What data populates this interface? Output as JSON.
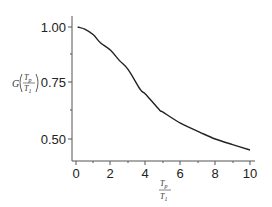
{
  "chart_data": {
    "type": "line",
    "title": "",
    "xlabel": "Tp/T1",
    "ylabel": "G(Tp/T1)",
    "xlim": [
      0,
      10
    ],
    "ylim": [
      0.45,
      1.02
    ],
    "x_ticks": [
      "0",
      "2",
      "4",
      "6",
      "8",
      "10"
    ],
    "y_ticks": [
      "1.00",
      "0.75",
      "0.50"
    ],
    "grid": false,
    "legend": null,
    "series": [
      {
        "name": "G(Tp/T1)",
        "x": [
          0.1,
          0.5,
          1.0,
          1.4,
          2.0,
          2.5,
          3.0,
          3.7,
          4.0,
          4.8,
          5.0,
          6.0,
          7.1,
          8.0,
          9.0,
          10.0
        ],
        "y": [
          1.0,
          0.99,
          0.965,
          0.93,
          0.895,
          0.85,
          0.81,
          0.72,
          0.7,
          0.63,
          0.62,
          0.571,
          0.531,
          0.5,
          0.475,
          0.451
        ]
      }
    ]
  },
  "axis": {
    "y_label_func": "G",
    "frac_num": "T",
    "frac_num_sub": "p",
    "frac_den": "T",
    "frac_den_sub": "1"
  }
}
